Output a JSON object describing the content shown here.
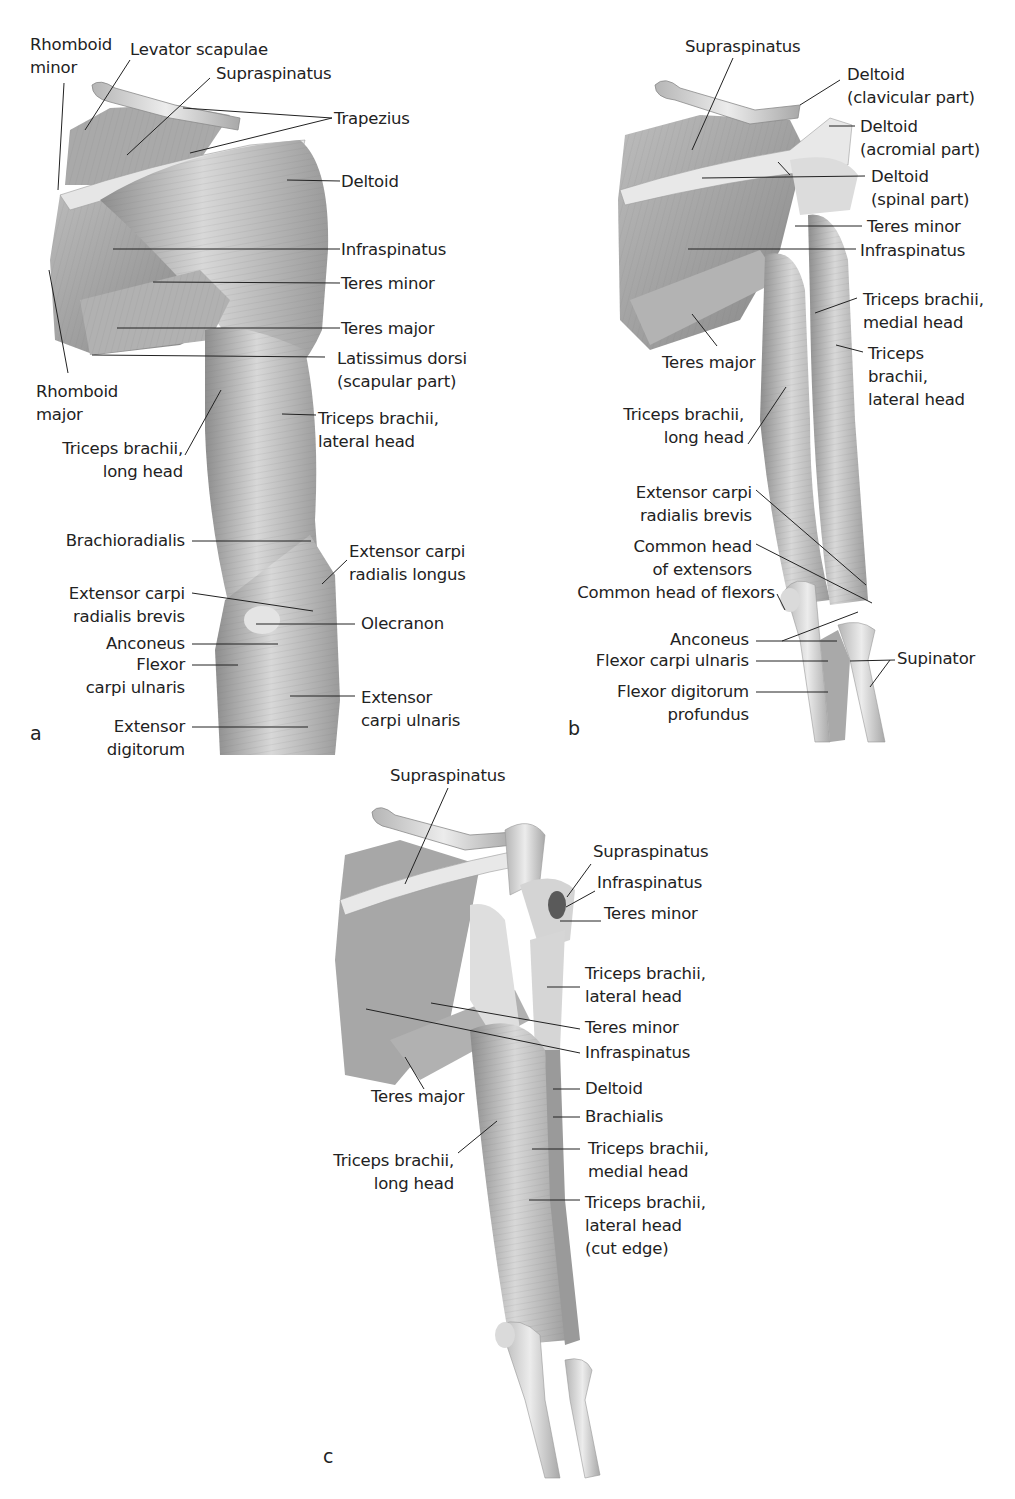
{
  "figure": {
    "panels": [
      {
        "id": "a",
        "letter": "a",
        "letter_pos": [
          30,
          735
        ],
        "labels": [
          {
            "text": "Rhomboid\nminor",
            "x": 30,
            "y": 33,
            "align": "left"
          },
          {
            "text": "Levator scapulae",
            "x": 130,
            "y": 38,
            "align": "left"
          },
          {
            "text": "Supraspinatus",
            "x": 216,
            "y": 62,
            "align": "left"
          },
          {
            "text": "Trapezius",
            "x": 334,
            "y": 107,
            "align": "left"
          },
          {
            "text": "Deltoid",
            "x": 341,
            "y": 170,
            "align": "left"
          },
          {
            "text": "Infraspinatus",
            "x": 341,
            "y": 238,
            "align": "left"
          },
          {
            "text": "Teres minor",
            "x": 341,
            "y": 272,
            "align": "left"
          },
          {
            "text": "Teres major",
            "x": 341,
            "y": 317,
            "align": "left"
          },
          {
            "text": "Latissimus dorsi\n(scapular part)",
            "x": 337,
            "y": 347,
            "align": "left"
          },
          {
            "text": "Rhomboid\nmajor",
            "x": 36,
            "y": 380,
            "align": "left"
          },
          {
            "text": "Triceps brachii,\nlateral head",
            "x": 318,
            "y": 407,
            "align": "left"
          },
          {
            "text": "Triceps brachii,\nlong head",
            "x": 183,
            "y": 437,
            "align": "right"
          },
          {
            "text": "Brachioradialis",
            "x": 185,
            "y": 529,
            "align": "right"
          },
          {
            "text": "Extensor carpi\nradialis longus",
            "x": 349,
            "y": 540,
            "align": "left"
          },
          {
            "text": "Extensor carpi\nradialis brevis",
            "x": 185,
            "y": 582,
            "align": "right"
          },
          {
            "text": "Olecranon",
            "x": 361,
            "y": 612,
            "align": "left"
          },
          {
            "text": "Anconeus",
            "x": 185,
            "y": 632,
            "align": "right"
          },
          {
            "text": "Flexor\ncarpi ulnaris",
            "x": 185,
            "y": 653,
            "align": "right"
          },
          {
            "text": "Extensor\ncarpi ulnaris",
            "x": 361,
            "y": 686,
            "align": "left"
          },
          {
            "text": "Extensor\ndigitorum",
            "x": 185,
            "y": 715,
            "align": "right"
          }
        ]
      },
      {
        "id": "b",
        "letter": "b",
        "letter_pos": [
          568,
          717
        ],
        "labels": [
          {
            "text": "Supraspinatus",
            "x": 685,
            "y": 35,
            "align": "left"
          },
          {
            "text": "Deltoid\n(clavicular part)",
            "x": 847,
            "y": 63,
            "align": "left"
          },
          {
            "text": "Deltoid\n(acromial part)",
            "x": 860,
            "y": 115,
            "align": "left"
          },
          {
            "text": "Deltoid\n(spinal part)",
            "x": 871,
            "y": 165,
            "align": "left"
          },
          {
            "text": "Teres minor",
            "x": 867,
            "y": 215,
            "align": "left"
          },
          {
            "text": "Infraspinatus",
            "x": 860,
            "y": 239,
            "align": "left"
          },
          {
            "text": "Triceps brachii,\nmedial head",
            "x": 863,
            "y": 288,
            "align": "left"
          },
          {
            "text": "Teres major",
            "x": 662,
            "y": 351,
            "align": "left"
          },
          {
            "text": "Triceps\nbrachii,\nlateral head",
            "x": 868,
            "y": 342,
            "align": "left"
          },
          {
            "text": "Triceps brachii,\nlong head",
            "x": 744,
            "y": 403,
            "align": "right"
          },
          {
            "text": "Extensor carpi\nradialis brevis",
            "x": 752,
            "y": 481,
            "align": "right"
          },
          {
            "text": "Common head\nof extensors",
            "x": 752,
            "y": 535,
            "align": "right"
          },
          {
            "text": "Common head of flexors",
            "x": 775,
            "y": 581,
            "align": "right"
          },
          {
            "text": "Anconeus",
            "x": 749,
            "y": 628,
            "align": "right"
          },
          {
            "text": "Flexor carpi ulnaris",
            "x": 749,
            "y": 649,
            "align": "right"
          },
          {
            "text": "Supinator",
            "x": 897,
            "y": 647,
            "align": "left"
          },
          {
            "text": "Flexor digitorum\nprofundus",
            "x": 749,
            "y": 680,
            "align": "right"
          }
        ]
      },
      {
        "id": "c",
        "letter": "c",
        "letter_pos": [
          323,
          1456
        ],
        "labels": [
          {
            "text": "Supraspinatus",
            "x": 390,
            "y": 764,
            "align": "left"
          },
          {
            "text": "Supraspinatus",
            "x": 593,
            "y": 840,
            "align": "left"
          },
          {
            "text": "Infraspinatus",
            "x": 597,
            "y": 871,
            "align": "left"
          },
          {
            "text": "Teres minor",
            "x": 604,
            "y": 902,
            "align": "left"
          },
          {
            "text": "Triceps brachii,\nlateral head",
            "x": 585,
            "y": 962,
            "align": "left"
          },
          {
            "text": "Teres minor",
            "x": 585,
            "y": 1016,
            "align": "left"
          },
          {
            "text": "Infraspinatus",
            "x": 585,
            "y": 1041,
            "align": "left"
          },
          {
            "text": "Teres major",
            "x": 371,
            "y": 1085,
            "align": "left"
          },
          {
            "text": "Deltoid",
            "x": 585,
            "y": 1077,
            "align": "left"
          },
          {
            "text": "Brachialis",
            "x": 585,
            "y": 1105,
            "align": "left"
          },
          {
            "text": "Triceps brachii,\nmedial head",
            "x": 588,
            "y": 1137,
            "align": "left"
          },
          {
            "text": "Triceps brachii,\nlong head",
            "x": 454,
            "y": 1149,
            "align": "right"
          },
          {
            "text": "Triceps brachii,\nlateral head\n(cut edge)",
            "x": 585,
            "y": 1191,
            "align": "left"
          }
        ]
      }
    ]
  }
}
